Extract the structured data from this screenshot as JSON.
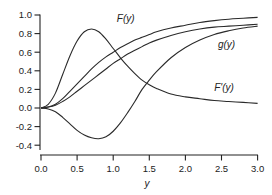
{
  "chart_data": {
    "type": "line",
    "title": "",
    "xlabel": "y",
    "ylabel": "",
    "xlim": [
      0,
      3.0
    ],
    "ylim": [
      -0.5,
      1.0
    ],
    "grid": false,
    "legend": "inline labels",
    "x_ticks": [
      "0.0",
      "0.5",
      "1.0",
      "1.5",
      "2.0",
      "2.5",
      "3.0"
    ],
    "y_ticks": [
      "1.0",
      "0.8",
      "0.6",
      "0.4",
      "0.2",
      "0.0",
      "-0.2",
      "-0.4"
    ],
    "x": [
      0.0,
      0.1,
      0.2,
      0.3,
      0.4,
      0.5,
      0.6,
      0.7,
      0.8,
      0.9,
      1.0,
      1.1,
      1.2,
      1.3,
      1.4,
      1.5,
      1.6,
      1.8,
      2.0,
      2.2,
      2.4,
      2.6,
      2.8,
      3.0
    ],
    "series": [
      {
        "name": "F(y)",
        "label": "F(y)",
        "values": [
          0.0,
          0.01,
          0.04,
          0.1,
          0.18,
          0.26,
          0.34,
          0.42,
          0.49,
          0.55,
          0.6,
          0.65,
          0.69,
          0.73,
          0.76,
          0.79,
          0.82,
          0.86,
          0.89,
          0.92,
          0.94,
          0.955,
          0.965,
          0.975
        ],
        "label_pos": [
          1.05,
          0.93
        ]
      },
      {
        "name": "g(y)",
        "label": "g(y)",
        "values": [
          0.0,
          0.01,
          0.03,
          0.07,
          0.12,
          0.18,
          0.24,
          0.3,
          0.36,
          0.42,
          0.48,
          0.53,
          0.58,
          0.62,
          0.66,
          0.7,
          0.73,
          0.78,
          0.82,
          0.85,
          0.87,
          0.88,
          0.89,
          0.9
        ],
        "label_pos": [
          2.45,
          0.65
        ]
      },
      {
        "name": "F'(y)",
        "label": "F'(y)",
        "values": [
          0.0,
          0.04,
          0.16,
          0.36,
          0.56,
          0.72,
          0.82,
          0.85,
          0.82,
          0.74,
          0.64,
          0.54,
          0.45,
          0.37,
          0.3,
          0.25,
          0.21,
          0.15,
          0.12,
          0.1,
          0.08,
          0.07,
          0.06,
          0.05
        ],
        "label_pos": [
          2.4,
          0.18
        ]
      },
      {
        "name": "g(y) lower branch",
        "label": "",
        "values": [
          0.0,
          -0.01,
          -0.04,
          -0.1,
          -0.17,
          -0.24,
          -0.29,
          -0.32,
          -0.33,
          -0.31,
          -0.25,
          -0.16,
          -0.05,
          0.07,
          0.2,
          0.3,
          0.39,
          0.54,
          0.65,
          0.73,
          0.79,
          0.83,
          0.86,
          0.88
        ],
        "label_pos": null
      }
    ]
  }
}
